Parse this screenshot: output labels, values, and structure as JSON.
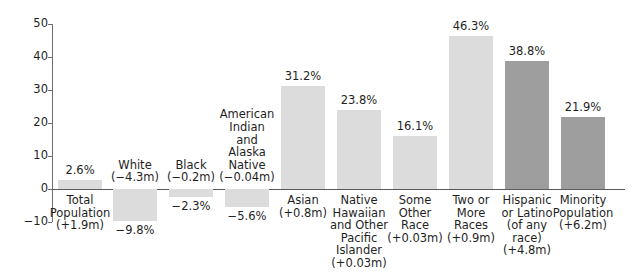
{
  "chart_data": {
    "type": "bar",
    "title": "",
    "subtitle": "",
    "xlabel": "",
    "ylabel": "",
    "ylim": [
      -10,
      50
    ],
    "yticks": [
      -10,
      0,
      10,
      20,
      30,
      40,
      50
    ],
    "ytick_labels": [
      "−10",
      "0",
      "10",
      "20",
      "30",
      "40",
      "50"
    ],
    "grid": false,
    "legend": "none",
    "value_suffix": "%",
    "categories": [
      "Total Population",
      "White",
      "Black",
      "American Indian and Alaska Native",
      "Asian",
      "Native Hawaiian and Other Pacific Islander",
      "Some Other Race",
      "Two or More Races",
      "Hispanic or Latino (of any race)",
      "Minority Population"
    ],
    "values": [
      2.6,
      -9.8,
      -2.3,
      -5.6,
      31.2,
      23.8,
      16.1,
      46.3,
      38.8,
      21.9
    ],
    "bars": [
      {
        "category_lines": "Total\nPopulation\n(+1.9m)",
        "value": 2.6,
        "value_label": "2.6%",
        "change": "+1.9m",
        "color_key": "light",
        "x": 58,
        "width": 44
      },
      {
        "category_lines": "White\n(−4.3m)",
        "value": -9.8,
        "value_label": "−9.8%",
        "change": "−4.3m",
        "color_key": "light",
        "x": 113,
        "width": 44
      },
      {
        "category_lines": "Black\n(−0.2m)",
        "value": -2.3,
        "value_label": "−2.3%",
        "change": "−0.2m",
        "color_key": "light",
        "x": 169,
        "width": 44
      },
      {
        "category_lines": "American\nIndian\nand\nAlaska\nNative\n(−0.04m)",
        "value": -5.6,
        "value_label": "−5.6%",
        "change": "−0.04m",
        "color_key": "light",
        "x": 225,
        "width": 44
      },
      {
        "category_lines": "Asian\n(+0.8m)",
        "value": 31.2,
        "value_label": "31.2%",
        "change": "+0.8m",
        "color_key": "light",
        "x": 281,
        "width": 44
      },
      {
        "category_lines": "Native\nHawaiian\nand Other\nPacific\nIslander\n(+0.03m)",
        "value": 23.8,
        "value_label": "23.8%",
        "change": "+0.03m",
        "color_key": "light",
        "x": 337,
        "width": 44
      },
      {
        "category_lines": "Some\nOther\nRace\n(+0.03m)",
        "value": 16.1,
        "value_label": "16.1%",
        "change": "+0.03m",
        "color_key": "light",
        "x": 393,
        "width": 44
      },
      {
        "category_lines": "Two or\nMore\nRaces\n(+0.9m)",
        "value": 46.3,
        "value_label": "46.3%",
        "change": "+0.9m",
        "color_key": "light",
        "x": 449,
        "width": 44
      },
      {
        "category_lines": "Hispanic\nor Latino\n(of any\nrace)\n(+4.8m)",
        "value": 38.8,
        "value_label": "38.8%",
        "change": "+4.8m",
        "color_key": "dark",
        "x": 505,
        "width": 44
      },
      {
        "category_lines": "Minority\nPopulation\n(+6.2m)",
        "value": 21.9,
        "value_label": "21.9%",
        "change": "+6.2m",
        "color_key": "dark",
        "x": 561,
        "width": 44
      }
    ],
    "colors": {
      "bar_light": "#dcdcdc",
      "bar_dark": "#9e9e9e",
      "axis": "#5a5a5a",
      "text": "#1f1f1f",
      "background": "#ffffff"
    }
  }
}
